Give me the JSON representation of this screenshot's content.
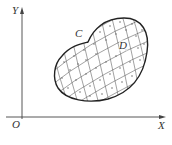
{
  "figure": {
    "axes": {
      "x_label": "X",
      "y_label": "Y",
      "origin_label": "O"
    },
    "region": {
      "boundary_label": "C",
      "region_label": "D",
      "pattern": "curvilinear grid with dots in each cell"
    },
    "colors": {
      "line": "#333333",
      "grid": "#555555",
      "background": "#ffffff"
    }
  }
}
